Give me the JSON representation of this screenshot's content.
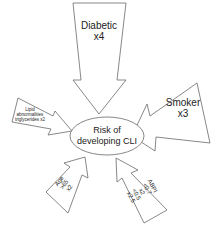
{
  "diagram": {
    "center": {
      "line1": "Risk of",
      "line2": "developing CLI"
    },
    "factors": [
      {
        "id": "diabetic",
        "lines": [
          "Diabetic",
          "x4"
        ]
      },
      {
        "id": "smoker",
        "lines": [
          "Smoker",
          "x3"
        ]
      },
      {
        "id": "lipid",
        "lines": [
          "Lipid",
          "abnormalities",
          "triglycerides x2"
        ]
      },
      {
        "id": "age",
        "lines": [
          "Age",
          ">65",
          "x2"
        ]
      },
      {
        "id": "abpi",
        "lines": [
          "ABPI",
          "<0.7",
          "x2",
          "<0.5",
          "x2.5"
        ]
      }
    ],
    "colors": {
      "stroke": "#6a6a6a",
      "text": "#222222",
      "background": "#ffffff"
    }
  }
}
